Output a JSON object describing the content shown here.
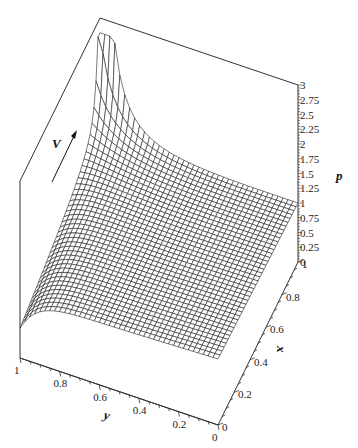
{
  "chart_data": {
    "type": "surface3d",
    "title": "",
    "axes": {
      "x": {
        "label": "x",
        "range": [
          0,
          1
        ],
        "ticks": [
          "0",
          "0.2",
          "0.4",
          "0.6",
          "0.8",
          "1"
        ]
      },
      "y": {
        "label": "y",
        "range": [
          0,
          1
        ],
        "ticks": [
          "0",
          "0.2",
          "0.4",
          "0.6",
          "0.8",
          "1"
        ]
      },
      "z": {
        "label": "p",
        "range": [
          0,
          3
        ],
        "ticks": [
          "0",
          "0.25",
          "0.5",
          "0.75",
          "1",
          "1.25",
          "1.5",
          "1.75",
          "2",
          "2.25",
          "2.5",
          "2.75",
          "3"
        ]
      }
    },
    "annotations": [
      {
        "text": "V",
        "type": "arrow",
        "direction": "up-right"
      }
    ],
    "mesh_resolution": [
      40,
      40
    ]
  },
  "labels": {
    "x_axis": "x",
    "y_axis": "y",
    "z_axis": "p",
    "arrow": "V"
  }
}
